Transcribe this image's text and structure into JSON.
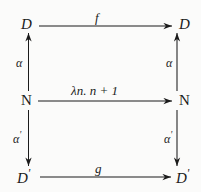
{
  "diagram": {
    "type": "commutative-diagram",
    "background_color": "#fbfbfa",
    "ink_color": "#1b1b1b",
    "nodes": [
      {
        "id": "d-topleft",
        "label": "D",
        "row": "top",
        "side": "left"
      },
      {
        "id": "d-topright",
        "label": "D",
        "row": "top",
        "side": "right"
      },
      {
        "id": "n-midleft",
        "label": "N",
        "row": "middle",
        "side": "left"
      },
      {
        "id": "n-midright",
        "label": "N",
        "row": "middle",
        "side": "right"
      },
      {
        "id": "dp-botleft",
        "label": "D",
        "prime": "'",
        "row": "bottom",
        "side": "left"
      },
      {
        "id": "dp-botright",
        "label": "D",
        "prime": "'",
        "row": "bottom",
        "side": "right"
      }
    ],
    "edges": [
      {
        "id": "f",
        "label": "f",
        "from": "d-topleft",
        "to": "d-topright",
        "direction": "right"
      },
      {
        "id": "lambda",
        "label": "λn. n + 1",
        "from": "n-midleft",
        "to": "n-midright",
        "direction": "right"
      },
      {
        "id": "g",
        "label": "g",
        "from": "dp-botleft",
        "to": "dp-botright",
        "direction": "right"
      },
      {
        "id": "alpha-left",
        "label": "α",
        "from": "n-midleft",
        "to": "d-topleft",
        "direction": "up"
      },
      {
        "id": "alpha-right",
        "label": "α",
        "from": "n-midright",
        "to": "d-topright",
        "direction": "up"
      },
      {
        "id": "alphap-left",
        "label": "α",
        "prime": "'",
        "from": "n-midleft",
        "to": "dp-botleft",
        "direction": "down"
      },
      {
        "id": "alphap-right",
        "label": "α",
        "prime": "'",
        "from": "n-midright",
        "to": "dp-botright",
        "direction": "down"
      }
    ]
  }
}
